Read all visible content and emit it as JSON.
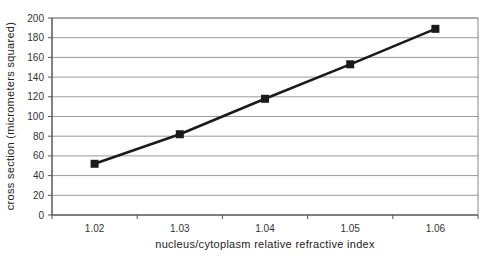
{
  "chart_data": {
    "type": "line",
    "title": "",
    "xlabel": "nucleus/cytoplasm relative refractive index",
    "ylabel": "cross section (micrometers squared)",
    "categories": [
      "1.02",
      "1.03",
      "1.04",
      "1.05",
      "1.06"
    ],
    "series": [
      {
        "name": "cross section",
        "values": [
          52,
          82,
          118,
          153,
          189
        ],
        "marker": "square",
        "color": "#1a1a1a"
      }
    ],
    "ylim": [
      0,
      200
    ],
    "yticks": [
      0,
      20,
      40,
      60,
      80,
      100,
      120,
      140,
      160,
      180,
      200
    ],
    "grid": {
      "horizontal": true,
      "vertical": false
    },
    "legend": null
  },
  "colors": {
    "line": "#1a1a1a",
    "grid": "#9a9a9a",
    "axis": "#555555",
    "background": "#ffffff"
  }
}
